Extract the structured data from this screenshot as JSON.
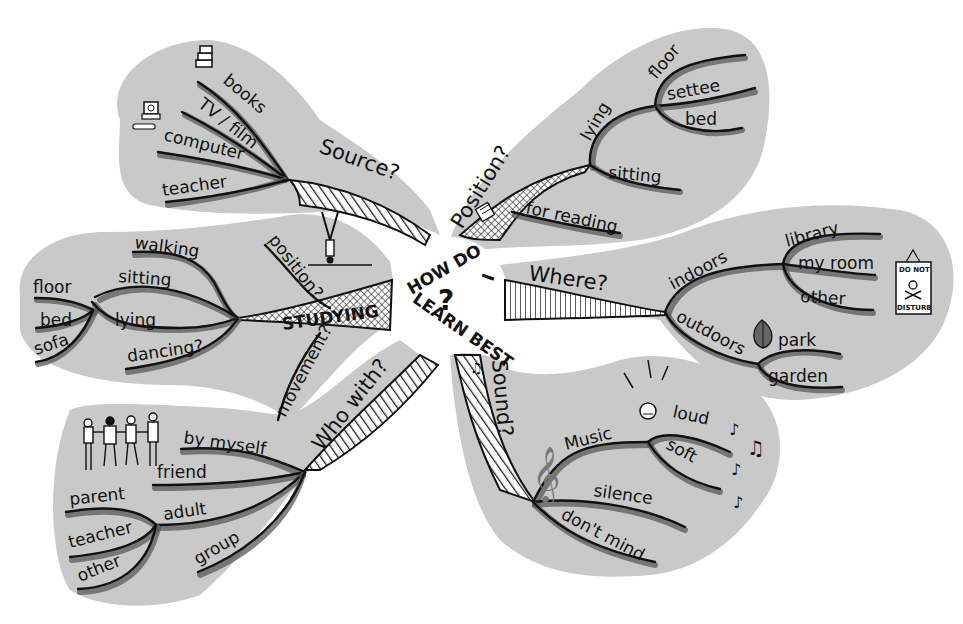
{
  "diagram": {
    "type": "mind-map",
    "center": {
      "line1": "HOW DO",
      "mark": "?",
      "line2": "LEARN BEST",
      "line3": "I"
    },
    "colors": {
      "blob": "#c9c9c9",
      "line": "#111111",
      "shadow": "#5a5a5a",
      "background": "#ffffff"
    },
    "branches": {
      "source": {
        "label": "Source?",
        "items": [
          "books",
          "TV / film",
          "computer",
          "teacher"
        ],
        "icons": [
          "books-icon",
          "computer-icon"
        ]
      },
      "position": {
        "label": "Position?",
        "lying": {
          "label": "lying",
          "items": [
            "floor",
            "settee",
            "bed"
          ]
        },
        "sitting": "sitting",
        "for_reading": "for reading",
        "icons": [
          "book-icon"
        ]
      },
      "studying": {
        "label": "STUDYING",
        "position": "position?",
        "movement": "movement?",
        "movement_items": [
          "walking",
          "sitting",
          "lying",
          "dancing?"
        ],
        "sub_items": [
          "floor",
          "bed",
          "sofa"
        ],
        "icons": [
          "headstand-figure-icon"
        ]
      },
      "where": {
        "label": "Where?",
        "indoors": {
          "label": "indoors",
          "items": [
            "library",
            "my room",
            "other"
          ]
        },
        "outdoors": {
          "label": "outdoors",
          "items": [
            "park",
            "garden"
          ]
        },
        "sign": {
          "top": "DO NOT",
          "bottom": "DISTURB"
        },
        "icons": [
          "leaf-icon",
          "do-not-disturb-sign-icon"
        ]
      },
      "sound": {
        "label": "Sound?",
        "music": {
          "label": "Music",
          "items": [
            "loud",
            "soft"
          ]
        },
        "silence": "silence",
        "dont_mind": "don't mind",
        "icons": [
          "treble-clef-icon",
          "music-notes-icon",
          "loud-face-icon"
        ]
      },
      "who_with": {
        "label": "Who with?",
        "items": [
          "by myself",
          "friend",
          "adult",
          "group"
        ],
        "adult_items": [
          "parent",
          "teacher",
          "other"
        ],
        "icons": [
          "group-of-people-icon"
        ]
      }
    }
  }
}
